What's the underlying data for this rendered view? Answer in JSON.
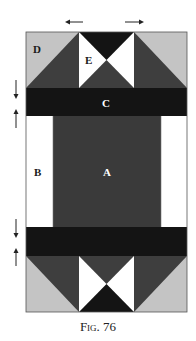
{
  "figure": {
    "caption_prefix": "Fig.",
    "caption_number": "76"
  },
  "labels": {
    "A": "A",
    "B": "B",
    "C": "C",
    "D": "D",
    "E": "E"
  },
  "colors": {
    "light_gray": "#c4c4c4",
    "dark_gray": "#3e3e3e",
    "black": "#141414",
    "white": "#ffffff",
    "center": "#3a3a3a"
  },
  "arrows": {
    "top_horizontal": [
      "left",
      "right"
    ],
    "left_vertical_upper": [
      "down",
      "up"
    ],
    "left_vertical_lower": [
      "down",
      "up"
    ]
  }
}
